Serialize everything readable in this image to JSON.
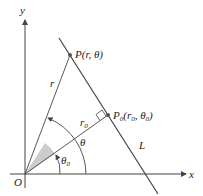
{
  "diagram": {
    "axes": {
      "x_label": "x",
      "y_label": "y",
      "origin_label": "O"
    },
    "points": {
      "P": {
        "label": "P(r, θ)"
      },
      "P0": {
        "label_main": "P",
        "label_sub": "0",
        "label_rest": "(r",
        "label_sub2": "0",
        "label_mid": ", θ",
        "label_sub3": "0",
        "label_end": ")"
      }
    },
    "segments": {
      "r": "r",
      "r0_main": "r",
      "r0_sub": "0"
    },
    "angles": {
      "theta": "θ",
      "theta0_main": "θ",
      "theta0_sub": "0"
    },
    "line": {
      "label": "L"
    },
    "colors": {
      "stroke": "#444444",
      "shade": "#cccccc"
    }
  }
}
